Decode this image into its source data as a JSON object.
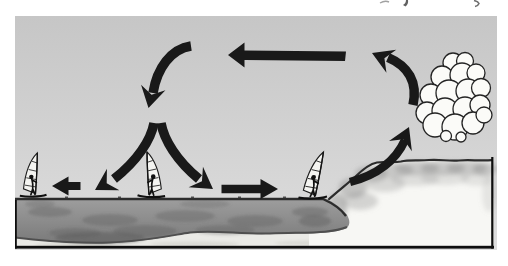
{
  "figure": {
    "type": "illustration-diagram",
    "colors": {
      "page_background": "#ffffff",
      "sky_top": "#c6c6c6",
      "sky_bottom": "#dedede",
      "sea_top": "#9e9e9e",
      "sea_bottom": "#7a7a7a",
      "sea_mottle": "#5f5f5f",
      "sand_strip": "#eaeae6",
      "land": "#f7f7f4",
      "terrain_outline": "#2c2c2c",
      "arrow": "#191919",
      "cloud_fill": "#fbfbf8",
      "cloud_outline": "#242424",
      "frame": "#0e0e0e",
      "sail": "#f4f4f1"
    },
    "elements": {
      "cloud": {
        "name": "cumulus-cloud",
        "position": "upper-right-over-land"
      },
      "windsurfers": [
        {
          "position": "far-left-on-sea"
        },
        {
          "position": "center-on-sea-between-diverging-arrows"
        },
        {
          "position": "right-near-shoreline"
        }
      ],
      "terrain": [
        {
          "name": "sea",
          "position": "left-two-thirds"
        },
        {
          "name": "shoreline-slope",
          "position": "center-right"
        },
        {
          "name": "land-hill",
          "position": "right"
        },
        {
          "name": "seabed-sand-strip",
          "position": "bottom"
        }
      ],
      "arrows": [
        {
          "name": "descending-air-arrow",
          "direction": "down",
          "position": "upper-center-left"
        },
        {
          "name": "return-flow-aloft-arrow",
          "direction": "left",
          "position": "top-center"
        },
        {
          "name": "surface-divergence-left-arrow",
          "direction": "down-left",
          "position": "center-above-sea"
        },
        {
          "name": "surface-divergence-right-arrow",
          "direction": "down-right",
          "position": "center-above-sea"
        },
        {
          "name": "offshore-surface-flow-arrow",
          "direction": "left",
          "position": "surface-left"
        },
        {
          "name": "onshore-surface-flow-arrow",
          "direction": "right",
          "position": "surface-center"
        },
        {
          "name": "rising-air-lower-arrow",
          "direction": "up",
          "position": "above-shoreline"
        },
        {
          "name": "rising-air-upper-arrow",
          "direction": "up-left",
          "position": "left-of-cloud"
        }
      ],
      "top_edge_marks": "illegible cropped text fragments from page above"
    }
  }
}
